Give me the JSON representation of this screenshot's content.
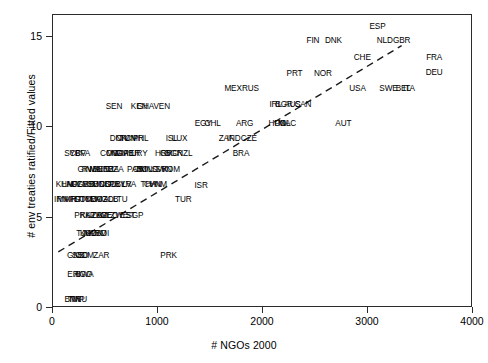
{
  "chart_data": {
    "type": "scatter",
    "title": "",
    "xlabel": "# NGOs 2000",
    "ylabel": "# env treaties ratified/Fitted values",
    "xlim": [
      0,
      4000
    ],
    "ylim": [
      0,
      16.2
    ],
    "xticks": [
      "0",
      "1000",
      "2000",
      "3000",
      "4000"
    ],
    "xtick_values": [
      0,
      1000,
      2000,
      3000,
      4000
    ],
    "yticks": [
      "0",
      "5",
      "10",
      "15"
    ],
    "ytick_values": [
      0,
      5,
      10,
      15
    ],
    "grid": false,
    "legend": "none",
    "fit_line": {
      "style": "dashed",
      "x_start": 60,
      "y_start": 3.05,
      "x_end": 3330,
      "y_end": 14.45
    },
    "point_labels": [
      {
        "label": "ESP",
        "x": 3100,
        "y": 15.55
      },
      {
        "label": "FIN",
        "x": 2485,
        "y": 14.75
      },
      {
        "label": "DNK",
        "x": 2680,
        "y": 14.75
      },
      {
        "label": "NLD",
        "x": 3170,
        "y": 14.75
      },
      {
        "label": "GBR",
        "x": 3330,
        "y": 14.75
      },
      {
        "label": "CHE",
        "x": 2955,
        "y": 13.8
      },
      {
        "label": "FRA",
        "x": 3640,
        "y": 13.8
      },
      {
        "label": "DEU",
        "x": 3640,
        "y": 13.0
      },
      {
        "label": "PRT",
        "x": 2310,
        "y": 12.95
      },
      {
        "label": "NOR",
        "x": 2580,
        "y": 12.95
      },
      {
        "label": "MEX",
        "x": 1725,
        "y": 12.1
      },
      {
        "label": "RUS",
        "x": 1890,
        "y": 12.1
      },
      {
        "label": "USA",
        "x": 2910,
        "y": 12.1
      },
      {
        "label": "SWE",
        "x": 3205,
        "y": 12.1
      },
      {
        "label": "BEL",
        "x": 3345,
        "y": 12.1
      },
      {
        "label": "ITA",
        "x": 3400,
        "y": 12.1
      },
      {
        "label": "IRL",
        "x": 2130,
        "y": 11.25
      },
      {
        "label": "BGR",
        "x": 2210,
        "y": 11.25
      },
      {
        "label": "AUS",
        "x": 2290,
        "y": 11.25
      },
      {
        "label": "CAN",
        "x": 2390,
        "y": 11.25
      },
      {
        "label": "SEN",
        "x": 590,
        "y": 11.1
      },
      {
        "label": "KEN",
        "x": 830,
        "y": 11.1
      },
      {
        "label": "GHA",
        "x": 890,
        "y": 11.1
      },
      {
        "label": "VEN",
        "x": 1045,
        "y": 11.1
      },
      {
        "label": "EGY",
        "x": 1440,
        "y": 10.2
      },
      {
        "label": "CHL",
        "x": 1530,
        "y": 10.2
      },
      {
        "label": "ARG",
        "x": 1835,
        "y": 10.2
      },
      {
        "label": "HUN",
        "x": 2145,
        "y": 10.2
      },
      {
        "label": "POL",
        "x": 2195,
        "y": 10.2
      },
      {
        "label": "MAC",
        "x": 2240,
        "y": 10.2
      },
      {
        "label": "AUT",
        "x": 2775,
        "y": 10.2
      },
      {
        "label": "DNK2",
        "x": 630,
        "y": 9.35
      },
      {
        "label": "CIV",
        "x": 670,
        "y": 9.35
      },
      {
        "label": "TUN",
        "x": 720,
        "y": 9.35
      },
      {
        "label": "CMR",
        "x": 785,
        "y": 9.35
      },
      {
        "label": "PHL",
        "x": 845,
        "y": 9.35
      },
      {
        "label": "ISL",
        "x": 1140,
        "y": 9.35
      },
      {
        "label": "LUX",
        "x": 1215,
        "y": 9.35
      },
      {
        "label": "ZAF",
        "x": 1660,
        "y": 9.35
      },
      {
        "label": "IND",
        "x": 1730,
        "y": 9.35
      },
      {
        "label": "CZE",
        "x": 1875,
        "y": 9.35
      },
      {
        "label": "SYC",
        "x": 195,
        "y": 8.5
      },
      {
        "label": "CPV",
        "x": 245,
        "y": 8.5
      },
      {
        "label": "BFA",
        "x": 290,
        "y": 8.5
      },
      {
        "label": "COG",
        "x": 545,
        "y": 8.5
      },
      {
        "label": "MWI",
        "x": 595,
        "y": 8.5
      },
      {
        "label": "NGA",
        "x": 645,
        "y": 8.5
      },
      {
        "label": "GMB",
        "x": 690,
        "y": 8.5
      },
      {
        "label": "PER",
        "x": 760,
        "y": 8.5
      },
      {
        "label": "URY",
        "x": 830,
        "y": 8.5
      },
      {
        "label": "HRV",
        "x": 1060,
        "y": 8.5
      },
      {
        "label": "GRC",
        "x": 1115,
        "y": 8.5
      },
      {
        "label": "BGR2",
        "x": 1160,
        "y": 8.5
      },
      {
        "label": "NZL",
        "x": 1265,
        "y": 8.5
      },
      {
        "label": "BRA",
        "x": 1800,
        "y": 8.5
      },
      {
        "label": "GIN",
        "x": 310,
        "y": 7.65
      },
      {
        "label": "RWA",
        "x": 370,
        "y": 7.65
      },
      {
        "label": "MLI",
        "x": 420,
        "y": 7.65
      },
      {
        "label": "BEN",
        "x": 465,
        "y": 7.65
      },
      {
        "label": "NER",
        "x": 510,
        "y": 7.65
      },
      {
        "label": "TZA",
        "x": 565,
        "y": 7.65
      },
      {
        "label": "DZA",
        "x": 605,
        "y": 7.65
      },
      {
        "label": "PAN",
        "x": 790,
        "y": 7.65
      },
      {
        "label": "CRI",
        "x": 835,
        "y": 7.65
      },
      {
        "label": "BOL",
        "x": 880,
        "y": 7.65
      },
      {
        "label": "MNG",
        "x": 925,
        "y": 7.65
      },
      {
        "label": "SVK",
        "x": 1025,
        "y": 7.65
      },
      {
        "label": "SVN",
        "x": 1065,
        "y": 7.65
      },
      {
        "label": "ROM",
        "x": 1130,
        "y": 7.65
      },
      {
        "label": "KHM",
        "x": 120,
        "y": 6.8
      },
      {
        "label": "LAO",
        "x": 170,
        "y": 6.8
      },
      {
        "label": "NPL",
        "x": 215,
        "y": 6.8
      },
      {
        "label": "UGA",
        "x": 265,
        "y": 6.8
      },
      {
        "label": "ZMB",
        "x": 320,
        "y": 6.8
      },
      {
        "label": "ETH",
        "x": 370,
        "y": 6.8
      },
      {
        "label": "SDN",
        "x": 420,
        "y": 6.8
      },
      {
        "label": "MDG",
        "x": 470,
        "y": 6.8
      },
      {
        "label": "COL",
        "x": 530,
        "y": 6.8
      },
      {
        "label": "BOL2",
        "x": 575,
        "y": 6.8
      },
      {
        "label": "PRY",
        "x": 620,
        "y": 6.8
      },
      {
        "label": "BLR",
        "x": 680,
        "y": 6.8
      },
      {
        "label": "LVA",
        "x": 735,
        "y": 6.8
      },
      {
        "label": "THA",
        "x": 920,
        "y": 6.8
      },
      {
        "label": "CHN",
        "x": 960,
        "y": 6.8
      },
      {
        "label": "VNM",
        "x": 1010,
        "y": 6.8
      },
      {
        "label": "IRN",
        "x": 85,
        "y": 5.95
      },
      {
        "label": "MMR",
        "x": 140,
        "y": 5.95
      },
      {
        "label": "AFG",
        "x": 195,
        "y": 5.95
      },
      {
        "label": "HTI",
        "x": 245,
        "y": 5.95
      },
      {
        "label": "SOM",
        "x": 295,
        "y": 5.95
      },
      {
        "label": "TCD",
        "x": 345,
        "y": 5.95
      },
      {
        "label": "YEM",
        "x": 395,
        "y": 5.95
      },
      {
        "label": "MOZ",
        "x": 445,
        "y": 5.95
      },
      {
        "label": "AGO",
        "x": 500,
        "y": 5.95
      },
      {
        "label": "ALB",
        "x": 560,
        "y": 5.95
      },
      {
        "label": "LTU",
        "x": 650,
        "y": 5.95
      },
      {
        "label": "TUR",
        "x": 1250,
        "y": 5.95
      },
      {
        "label": "PRK",
        "x": 290,
        "y": 5.1
      },
      {
        "label": "KAZ",
        "x": 340,
        "y": 5.1
      },
      {
        "label": "UZB",
        "x": 400,
        "y": 5.1
      },
      {
        "label": "TKM",
        "x": 450,
        "y": 5.1
      },
      {
        "label": "AZE",
        "x": 500,
        "y": 5.1
      },
      {
        "label": "GEO",
        "x": 545,
        "y": 5.1
      },
      {
        "label": "ZWE",
        "x": 640,
        "y": 5.1
      },
      {
        "label": "EST",
        "x": 720,
        "y": 5.1
      },
      {
        "label": "SGP",
        "x": 790,
        "y": 5.1
      },
      {
        "label": "ISR",
        "x": 1420,
        "y": 6.75
      },
      {
        "label": "TJK",
        "x": 300,
        "y": 4.1
      },
      {
        "label": "KGZ",
        "x": 345,
        "y": 4.1
      },
      {
        "label": "MDA",
        "x": 390,
        "y": 4.1
      },
      {
        "label": "ARM",
        "x": 435,
        "y": 4.1
      },
      {
        "label": "BDI",
        "x": 480,
        "y": 4.1
      },
      {
        "label": "GNB",
        "x": 225,
        "y": 2.9
      },
      {
        "label": "SSD",
        "x": 270,
        "y": 2.9
      },
      {
        "label": "COM",
        "x": 310,
        "y": 2.9
      },
      {
        "label": "ZAR",
        "x": 470,
        "y": 2.9
      },
      {
        "label": "PRK2",
        "x": 1110,
        "y": 2.9
      },
      {
        "label": "ERI",
        "x": 210,
        "y": 1.8
      },
      {
        "label": "AGO2",
        "x": 295,
        "y": 1.8
      },
      {
        "label": "BWA",
        "x": 310,
        "y": 1.8
      },
      {
        "label": "BTN",
        "x": 195,
        "y": 0.45
      },
      {
        "label": "TMP",
        "x": 230,
        "y": 0.45
      },
      {
        "label": "NRU",
        "x": 250,
        "y": 0.45
      }
    ]
  },
  "axis": {
    "xlabel": "# NGOs 2000",
    "ylabel": "# env treaties ratified/Fitted values"
  },
  "labels": {
    "l0": "ESP",
    "l1": "FIN",
    "l2": "DNK",
    "l3": "NLD",
    "l4": "GBR",
    "l5": "CHE",
    "l6": "FRA",
    "l7": "DEU",
    "l8": "PRT",
    "l9": "NOR",
    "l10": "MEX",
    "l11": "RUS",
    "l12": "USA",
    "l13": "SWE",
    "l14": "BEL",
    "l15": "ITA",
    "l16": "IRL",
    "l17": "BGR",
    "l18": "AUS",
    "l19": "CAN",
    "l20": "SEN",
    "l21": "KEN",
    "l22": "GHA",
    "l23": "VEN",
    "l24": "EGY",
    "l25": "CHL",
    "l26": "ARG",
    "l27": "HUN",
    "l28": "POL",
    "l29": "MAC",
    "l30": "AUT",
    "l31": "DNK",
    "l32": "CIV",
    "l33": "TUN",
    "l34": "CMR",
    "l35": "PHL",
    "l36": "ISL",
    "l37": "LUX",
    "l38": "ZAF",
    "l39": "IND",
    "l40": "CZE",
    "l41": "SYC",
    "l42": "CPV",
    "l43": "BFA",
    "l44": "COG",
    "l45": "MWI",
    "l46": "NGA",
    "l47": "GMB",
    "l48": "PER",
    "l49": "URY",
    "l50": "HRV",
    "l51": "GRC",
    "l52": "BGR",
    "l53": "NZL",
    "l54": "BRA",
    "l55": "GIN",
    "l56": "RWA",
    "l57": "MLI",
    "l58": "BEN",
    "l59": "NER",
    "l60": "TZA",
    "l61": "DZA",
    "l62": "PAN",
    "l63": "CRI",
    "l64": "BOL",
    "l65": "MNG",
    "l66": "SVK",
    "l67": "SVN",
    "l68": "ROM",
    "l69": "KHM",
    "l70": "LAO",
    "l71": "NPL",
    "l72": "UGA",
    "l73": "ZMB",
    "l74": "ETH",
    "l75": "SDN",
    "l76": "MDG",
    "l77": "COL",
    "l78": "BOL",
    "l79": "PRY",
    "l80": "BLR",
    "l81": "LVA",
    "l82": "THA",
    "l83": "CHN",
    "l84": "VNM",
    "l85": "IRN",
    "l86": "MMR",
    "l87": "AFG",
    "l88": "HTI",
    "l89": "SOM",
    "l90": "TCD",
    "l91": "YEM",
    "l92": "MOZ",
    "l93": "AGO",
    "l94": "ALB",
    "l95": "LTU",
    "l96": "TUR",
    "l97": "PRK",
    "l98": "KAZ",
    "l99": "UZB",
    "l100": "TKM",
    "l101": "AZE",
    "l102": "GEO",
    "l103": "ZWE",
    "l104": "EST",
    "l105": "SGP",
    "l106": "ISR",
    "l107": "TJK",
    "l108": "KGZ",
    "l109": "MDA",
    "l110": "ARM",
    "l111": "BDI",
    "l112": "GNB",
    "l113": "SSD",
    "l114": "COM",
    "l115": "ZAR",
    "l116": "PRK",
    "l117": "ERI",
    "l118": "AGO",
    "l119": "BWA",
    "l120": "BTN",
    "l121": "TMP",
    "l122": "NRU"
  }
}
